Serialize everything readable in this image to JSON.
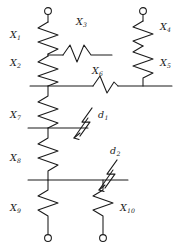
{
  "figure": {
    "type": "electrical-network-schematic",
    "stroke_color": "#1a1a1a",
    "background_color": "#ffffff",
    "width": 182,
    "height": 250
  },
  "branches": [
    {
      "id": "X1",
      "label": "X",
      "subscript": "1",
      "orientation": "vertical",
      "label_x": 10,
      "label_y": 35
    },
    {
      "id": "X2",
      "label": "X",
      "subscript": "2",
      "orientation": "vertical",
      "label_x": 10,
      "label_y": 63
    },
    {
      "id": "X3",
      "label": "X",
      "subscript": "3",
      "orientation": "horizontal",
      "label_x": 76,
      "label_y": 17
    },
    {
      "id": "X4",
      "label": "X",
      "subscript": "4",
      "orientation": "vertical",
      "label_x": 160,
      "label_y": 22
    },
    {
      "id": "X5",
      "label": "X",
      "subscript": "5",
      "orientation": "vertical",
      "label_x": 160,
      "label_y": 58
    },
    {
      "id": "X6",
      "label": "X",
      "subscript": "6",
      "orientation": "horizontal",
      "label_x": 92,
      "label_y": 70
    },
    {
      "id": "X7",
      "label": "X",
      "subscript": "7",
      "orientation": "vertical",
      "label_x": 10,
      "label_y": 115
    },
    {
      "id": "X8",
      "label": "X",
      "subscript": "8",
      "orientation": "vertical",
      "label_x": 10,
      "label_y": 158
    },
    {
      "id": "X9",
      "label": "X",
      "subscript": "9",
      "orientation": "vertical",
      "label_x": 10,
      "label_y": 208
    },
    {
      "id": "X10",
      "label": "X",
      "subscript": "10",
      "orientation": "vertical",
      "label_x": 110,
      "label_y": 208
    }
  ],
  "faults": [
    {
      "id": "d1",
      "label": "d",
      "subscript": "1",
      "label_x": 100,
      "label_y": 118,
      "on": "left-branch-stub"
    },
    {
      "id": "d2",
      "label": "d",
      "subscript": "2",
      "label_x": 110,
      "label_y": 152,
      "on": "lower-busbar"
    }
  ],
  "terminals": [
    {
      "id": "terminal-top-left",
      "x": 48,
      "y": 11
    },
    {
      "id": "terminal-top-right",
      "x": 143,
      "y": 11
    },
    {
      "id": "terminal-bottom-left",
      "x": 48,
      "y": 238
    },
    {
      "id": "terminal-bottom-right",
      "x": 103,
      "y": 238
    }
  ],
  "busbars": [
    {
      "id": "upper-busbar",
      "y": 86,
      "x_start": 30,
      "x_end": 172
    },
    {
      "id": "lower-busbar",
      "y": 180,
      "x_start": 28,
      "x_end": 128
    }
  ]
}
